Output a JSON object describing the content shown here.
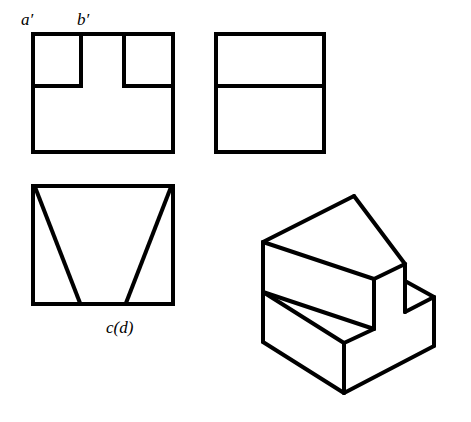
{
  "labels": {
    "a_prime": "a′",
    "b_prime": "b′",
    "c_d": "c(d)"
  },
  "colors": {
    "stroke": "#000000",
    "background": "#ffffff"
  },
  "views": {
    "front": {
      "rect": [
        33,
        34,
        140,
        118
      ],
      "notch_lines": [
        [
          81,
          34,
          81,
          86
        ],
        [
          33,
          86,
          81,
          86
        ],
        [
          124,
          34,
          124,
          86
        ],
        [
          124,
          86,
          173,
          86
        ]
      ]
    },
    "side": {
      "rect": [
        216,
        34,
        108,
        118
      ],
      "lines": [
        [
          216,
          86,
          324,
          86
        ]
      ]
    },
    "top": {
      "rect": [
        33,
        186,
        140,
        118
      ],
      "lines": [
        [
          35,
          187,
          80,
          303
        ],
        [
          171,
          187,
          126,
          303
        ]
      ]
    },
    "isometric": {
      "lines": [
        [
          263,
          242,
          354,
          196
        ],
        [
          354,
          196,
          405,
          264
        ],
        [
          263,
          242,
          374,
          279
        ],
        [
          374,
          279,
          405,
          264
        ],
        [
          263,
          242,
          263,
          342
        ],
        [
          374,
          279,
          374,
          329
        ],
        [
          263,
          292,
          374,
          329
        ],
        [
          263,
          292,
          344,
          343
        ],
        [
          344,
          343,
          374,
          329
        ],
        [
          263,
          342,
          344,
          393
        ],
        [
          344,
          343,
          344,
          393
        ],
        [
          344,
          393,
          434,
          346
        ],
        [
          405,
          264,
          405,
          312
        ],
        [
          405,
          312,
          434,
          297
        ],
        [
          405,
          281,
          434,
          297
        ],
        [
          434,
          297,
          434,
          346
        ]
      ]
    }
  }
}
